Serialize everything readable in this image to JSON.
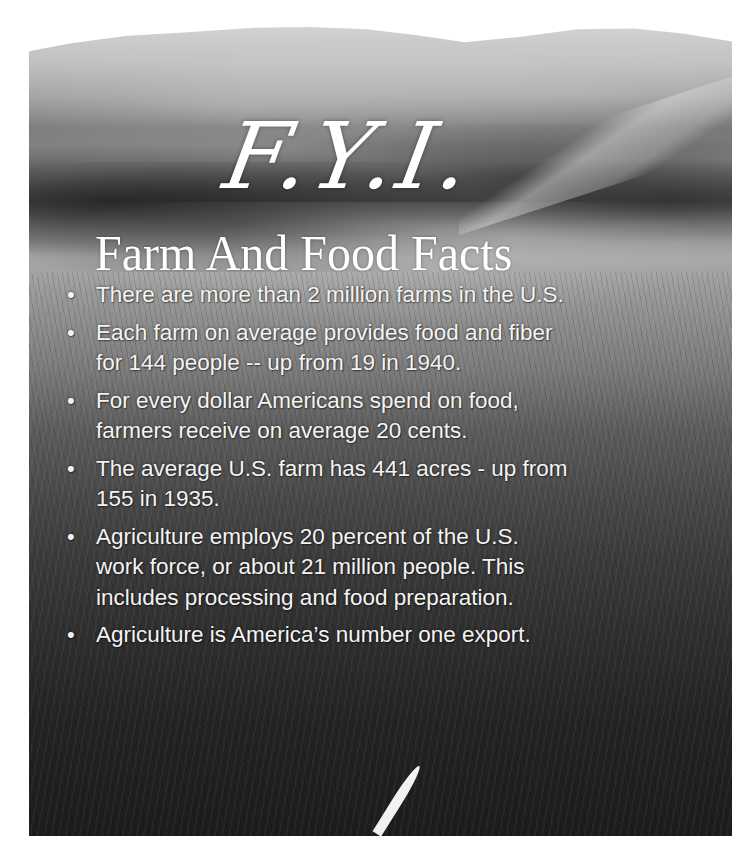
{
  "poster": {
    "heading": "F.Y.I.",
    "subtitle": "Farm And Food Facts",
    "bullet_glyph": "•",
    "facts": [
      {
        "lines": [
          "There are more than 2 million farms in the U.S."
        ]
      },
      {
        "lines": [
          "Each farm on average provides food and fiber",
          "for 144 people -- up  from 19 in 1940."
        ]
      },
      {
        "lines": [
          "For every dollar Americans spend on food,",
          "farmers receive on average 20 cents."
        ]
      },
      {
        "lines": [
          "The average U.S. farm has 441 acres - up from",
          "155 in 1935."
        ]
      },
      {
        "lines": [
          "Agriculture employs 20 percent of the U.S.",
          "work force, or about  21 million people. This",
          "includes processing and food preparation."
        ]
      },
      {
        "lines": [
          "Agriculture is America’s number one export."
        ]
      }
    ],
    "background_image": "black-and-white rural landscape: forested hills, farm buildings, field and tall grass",
    "colors": {
      "page_background": "#ffffff",
      "text": "#f4f4f4"
    }
  }
}
